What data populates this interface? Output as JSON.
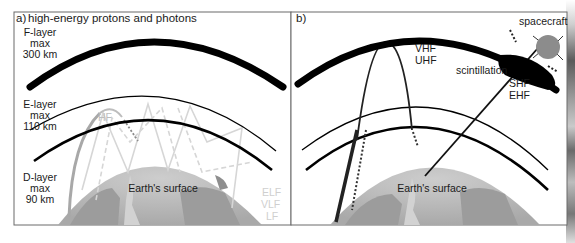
{
  "panel_a": {
    "label": "a)",
    "title": "high-energy protons and photons",
    "f_layer": {
      "line1": "F-layer",
      "line2": "max",
      "line3": "300 km"
    },
    "e_layer": {
      "line1": "E-layer",
      "line2": "max",
      "line3": "110 km"
    },
    "d_layer": {
      "line1": "D-layer",
      "line2": "max",
      "line3": "90 km"
    },
    "band_hf": "HF",
    "band_elf": "ELF",
    "band_vlf": "VLF",
    "band_lf": "LF",
    "earth_label": "Earth's surface"
  },
  "panel_b": {
    "label": "b)",
    "band_vhf": "VHF",
    "band_uhf": "UHF",
    "scintillation": "scintillation",
    "band_shf": "SHF",
    "band_ehf": "EHF",
    "spacecraft": "spacecraft",
    "earth_label": "Earth's surface"
  },
  "colors": {
    "layer_ink": "#000000",
    "earth_light": "#bdbdbd",
    "earth_dark": "#9a9a9a",
    "spacecraft_fill": "#8c8c8c",
    "faint_path": "#d6d6d6",
    "hf_path": "#a8a8a8"
  }
}
